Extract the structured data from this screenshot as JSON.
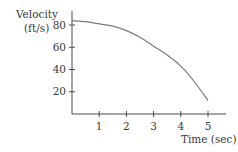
{
  "chart_data": {
    "type": "line",
    "title": "",
    "xlabel": "Time (sec)",
    "ylabel": "Velocity (ft/s)",
    "ylabel_lines": [
      "Velocity",
      "(ft/s)"
    ],
    "x_ticks": [
      1,
      2,
      3,
      4,
      5
    ],
    "y_ticks": [
      20,
      40,
      60,
      80
    ],
    "xlim": [
      0,
      5.6
    ],
    "ylim": [
      0,
      90
    ],
    "grid": false,
    "legend": null,
    "series": [
      {
        "name": "velocity",
        "x": [
          0,
          0.5,
          1,
          1.5,
          2,
          2.5,
          3,
          3.5,
          4,
          4.5,
          5
        ],
        "values": [
          84,
          83,
          81,
          79,
          75,
          69,
          61,
          53,
          43,
          29,
          12
        ]
      }
    ],
    "colors": {
      "axis": "#4a4a4a",
      "line": "#7a7a7a",
      "text": "#3a3a3a"
    }
  }
}
